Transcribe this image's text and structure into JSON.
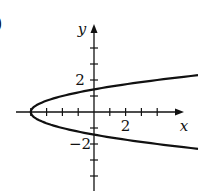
{
  "figure": {
    "part_label": ")"
  },
  "chart_data": {
    "type": "line",
    "title": "",
    "xlabel": "x",
    "ylabel": "y",
    "xlim": [
      -5,
      7
    ],
    "ylim": [
      -6,
      5
    ],
    "grid": false,
    "x_tick_positions": [
      -4,
      -3,
      -2,
      -1,
      1,
      2,
      3,
      4
    ],
    "y_tick_positions": [
      -5,
      -4,
      -3,
      -2,
      -1,
      1,
      2,
      3,
      4
    ],
    "x_tick_labels": [
      {
        "value": 2,
        "label": "2"
      }
    ],
    "y_tick_labels": [
      {
        "value": 2,
        "label": "2"
      },
      {
        "value": -2,
        "label": "−2"
      }
    ],
    "series": [
      {
        "name": "parabola opening right (approx. x = 2y² − 4)",
        "vertex": [
          -4,
          0
        ],
        "y_intercepts": [
          1.41,
          -1.41
        ],
        "x": [
          6.6,
          4,
          2,
          0,
          -2,
          -3,
          -4,
          -3,
          -2,
          0,
          2,
          4,
          6.6
        ],
        "y": [
          2.3,
          2.0,
          1.73,
          1.41,
          1.0,
          0.71,
          0,
          -0.71,
          -1.0,
          -1.41,
          -1.73,
          -2.0,
          -2.3
        ]
      }
    ],
    "colors": {
      "curve": "#111111",
      "axes": "#111111"
    }
  }
}
